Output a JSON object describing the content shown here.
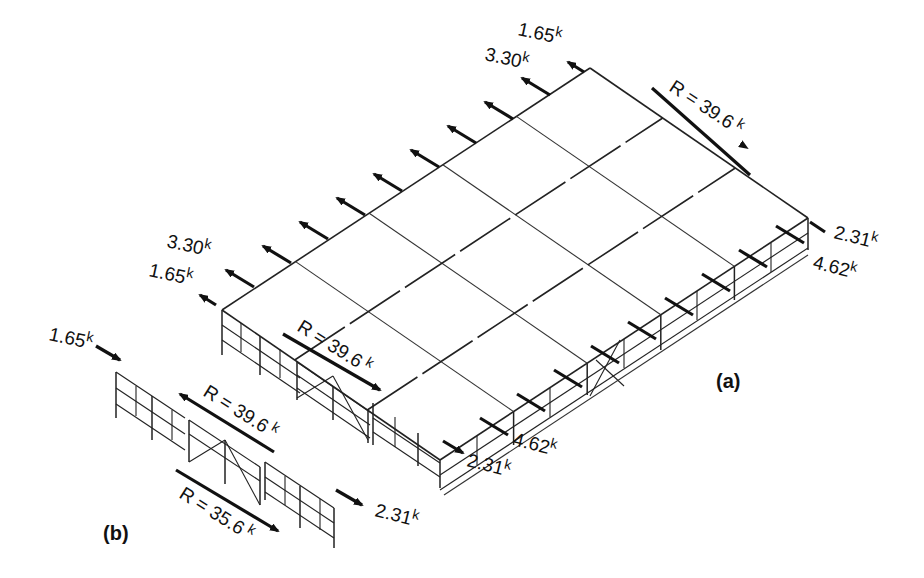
{
  "figure": {
    "panels": [
      {
        "id": "a",
        "label": "(a)"
      },
      {
        "id": "b",
        "label": "(b)"
      }
    ],
    "panel_a": {
      "roof_edge_loads_back": {
        "end_load": "1.65",
        "interior_load": "3.30",
        "unit": "k"
      },
      "roof_edge_loads_left": {
        "interior_load": "3.30",
        "end_load": "1.65",
        "unit": "k"
      },
      "resultant_top": {
        "text": "R = 39.6",
        "unit": "k"
      },
      "resultant_front": {
        "text": "R = 39.6",
        "unit": "k"
      },
      "right_wall_loads": {
        "end_load": "2.31",
        "interior_load": "4.62",
        "unit": "k"
      },
      "front_wall_loads": {
        "interior_load": "4.62",
        "end_load": "2.31",
        "unit": "k"
      }
    },
    "panel_b": {
      "applied_load_left": {
        "value": "1.65",
        "unit": "k"
      },
      "resultant_top": {
        "text": "R = 39.6",
        "unit": "k"
      },
      "resultant_bottom": {
        "text": "R = 35.6",
        "unit": "k"
      },
      "applied_load_right": {
        "value": "2.31",
        "unit": "k"
      }
    }
  }
}
